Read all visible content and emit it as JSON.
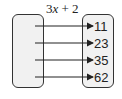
{
  "diagram": {
    "type": "mapping-diagram",
    "rule": {
      "prefix": "3",
      "variable": "x",
      "suffix": " + 2"
    },
    "domain": [],
    "range": [
      "11",
      "23",
      "35",
      "62"
    ],
    "arrow_y": [
      26,
      43,
      60,
      77
    ]
  }
}
